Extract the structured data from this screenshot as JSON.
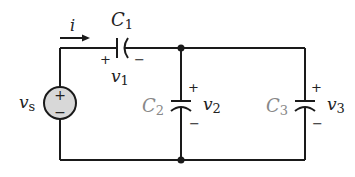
{
  "diagram": {
    "type": "circuit",
    "source": {
      "label": "v",
      "subscript": "s",
      "plus": "+",
      "minus": "−",
      "fill": "#d8d8d8"
    },
    "current": {
      "label": "i"
    },
    "capacitors": [
      {
        "id": "C1",
        "label": "C",
        "subscript": "1",
        "voltage_label": "v",
        "voltage_subscript": "1",
        "plus": "+",
        "minus": "−"
      },
      {
        "id": "C2",
        "label": "C",
        "subscript": "2",
        "voltage_label": "v",
        "voltage_subscript": "2",
        "plus": "+",
        "minus": "−"
      },
      {
        "id": "C3",
        "label": "C",
        "subscript": "3",
        "voltage_label": "v",
        "voltage_subscript": "3",
        "plus": "+",
        "minus": "−"
      }
    ],
    "colors": {
      "wire": "#1a1a1a",
      "label_gray": "#888888"
    }
  }
}
